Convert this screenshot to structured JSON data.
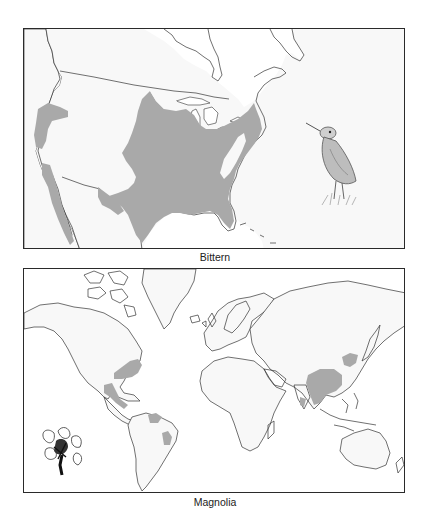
{
  "figures": [
    {
      "id": "north-america-range",
      "caption": "Bittern",
      "region": "North America",
      "range_color": "#a9a9a9",
      "illustration": "bittern-bird",
      "range_areas": [
        "Central and eastern United States and south-central Canada",
        "Western US intermountain region",
        "California coast and Baja / western Mexico",
        "Gulf coast into Mexico"
      ]
    },
    {
      "id": "world-range",
      "caption": "Magnolia",
      "region": "World",
      "range_color": "#a9a9a9",
      "illustration": "magnolia-flower",
      "range_areas": [
        "Southeastern United States",
        "Mexico and Central America",
        "Northern South America (Amazon)",
        "Eastern Brazil",
        "Southern and eastern China",
        "Korea / Northeast China",
        "Southeast Asia"
      ]
    }
  ]
}
